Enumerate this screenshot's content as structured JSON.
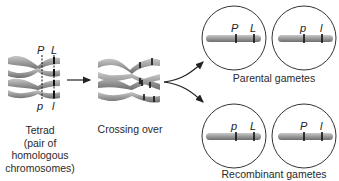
{
  "stages": {
    "tetrad": {
      "label_lines": [
        "Tetrad",
        "(pair of",
        "homologous",
        "chromosomes)"
      ],
      "genes_top": [
        "P",
        "L"
      ],
      "genes_bottom": [
        "p",
        "l"
      ]
    },
    "crossing_over": {
      "label": "Crossing over"
    },
    "parental": {
      "label": "Parental gametes",
      "gametes": [
        {
          "genes": [
            "P",
            "L"
          ]
        },
        {
          "genes": [
            "p",
            "l"
          ]
        }
      ]
    },
    "recombinant": {
      "label": "Recombinant gametes",
      "gametes": [
        {
          "genes": [
            "p",
            "L"
          ]
        },
        {
          "genes": [
            "P",
            "l"
          ]
        }
      ]
    }
  },
  "colors": {
    "chromosome": "#9a9a9a",
    "chromosome_dark": "#6e6e6e",
    "outline": "#333333",
    "band": "#111111"
  }
}
